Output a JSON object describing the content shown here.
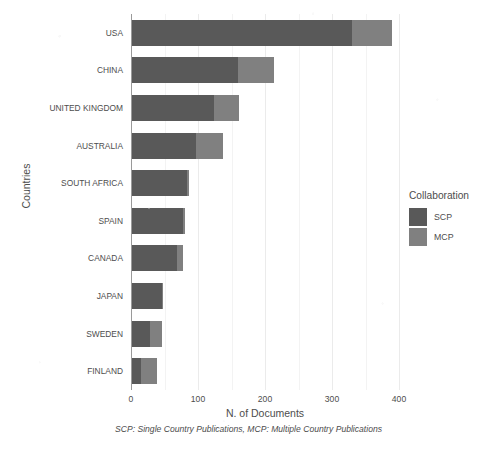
{
  "chart_data": {
    "type": "bar",
    "orientation": "horizontal",
    "stacked": true,
    "title": "",
    "xlabel": "N. of Documents",
    "ylabel": "Countries",
    "caption": "SCP: Single Country Publications, MCP: Multiple Country Publications",
    "xlim": [
      0,
      400
    ],
    "xticks": [
      0,
      100,
      200,
      300,
      400
    ],
    "xticklabels": [
      "0",
      "100",
      "200",
      "300",
      "400"
    ],
    "xminorticks": [
      50,
      150,
      250,
      350
    ],
    "grid": true,
    "legend": {
      "title": "Collaboration",
      "position": "right",
      "entries": [
        {
          "label": "SCP",
          "color": "#595959"
        },
        {
          "label": "MCP",
          "color": "#808080"
        }
      ]
    },
    "categories": [
      "USA",
      "CHINA",
      "UNITED KINGDOM",
      "AUSTRALIA",
      "SOUTH AFRICA",
      "SPAIN",
      "CANADA",
      "JAPAN",
      "SWEDEN",
      "FINLAND"
    ],
    "series": [
      {
        "name": "SCP",
        "color": "#595959",
        "values": [
          330,
          160,
          124,
          97,
          83,
          77,
          68,
          46,
          29,
          15
        ]
      },
      {
        "name": "MCP",
        "color": "#808080",
        "values": [
          59,
          53,
          37,
          41,
          3,
          3,
          9,
          2,
          18,
          24
        ]
      }
    ],
    "totals": [
      389,
      213,
      161,
      138,
      86,
      80,
      77,
      48,
      47,
      39
    ]
  },
  "legend": {
    "title": "Collaboration",
    "items": [
      {
        "label": "SCP"
      },
      {
        "label": "MCP"
      }
    ]
  },
  "axes": {
    "x_title": "N. of Documents",
    "y_title": "Countries",
    "x_ticks": [
      "0",
      "100",
      "200",
      "300",
      "400"
    ]
  },
  "caption": "SCP: Single Country Publications, MCP: Multiple Country Publications"
}
